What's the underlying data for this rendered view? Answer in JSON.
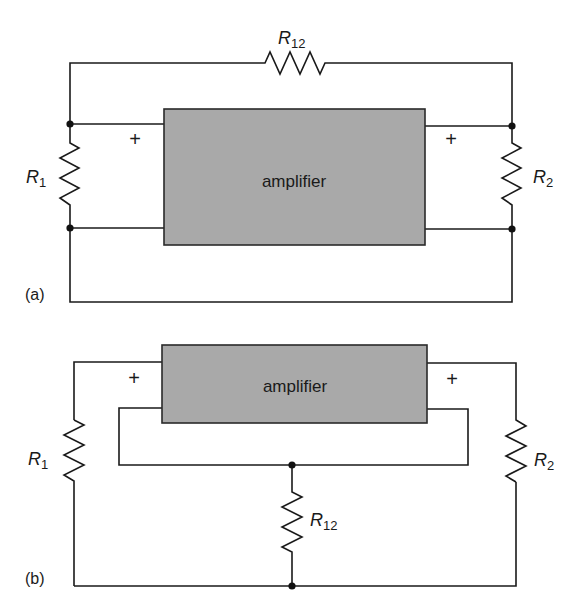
{
  "figure": {
    "panels": [
      {
        "id": "a",
        "label": "(a)",
        "amplifier_label": "amplifier",
        "input_polarity": "+",
        "output_polarity": "+",
        "resistors": {
          "r1": {
            "name": "R",
            "sub": "1"
          },
          "r2": {
            "name": "R",
            "sub": "2"
          },
          "r12": {
            "name": "R",
            "sub": "12"
          }
        },
        "description": "R12 connects input top node to output top node (shunt feedback); R1 across input, R2 across output"
      },
      {
        "id": "b",
        "label": "(b)",
        "amplifier_label": "amplifier",
        "input_polarity": "+",
        "output_polarity": "+",
        "resistors": {
          "r1": {
            "name": "R",
            "sub": "1"
          },
          "r2": {
            "name": "R",
            "sub": "2"
          },
          "r12": {
            "name": "R",
            "sub": "12"
          }
        },
        "description": "R12 in common return path between amplifier ground and outer loop (series feedback)"
      }
    ],
    "colors": {
      "wire": "#1a1a1a",
      "amplifier_fill": "#a9a9a9",
      "background": "#ffffff"
    }
  }
}
